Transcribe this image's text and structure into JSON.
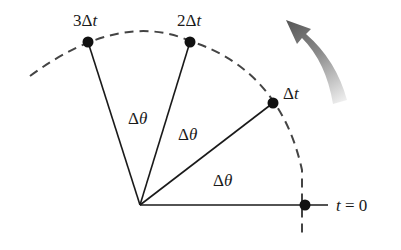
{
  "diagram": {
    "type": "uniform circular motion angular displacement",
    "colors": {
      "line": "#1a1a1a",
      "dot": "#111111",
      "arc": "#444444",
      "arrow_dark": "#555555",
      "arrow_light": "#e6e6e6",
      "background": "#ffffff"
    },
    "origin": {
      "x": 140,
      "y": 205
    },
    "points": [
      {
        "id": "t0",
        "x": 305,
        "y": 205,
        "label_prefix": "",
        "label_var": "t",
        "label_suffix": " = 0"
      },
      {
        "id": "dt1",
        "x": 273,
        "y": 103,
        "label_prefix": "Δ",
        "label_var": "t",
        "label_suffix": ""
      },
      {
        "id": "dt2",
        "x": 190,
        "y": 42,
        "label_prefix": "2Δ",
        "label_var": "t",
        "label_suffix": ""
      },
      {
        "id": "dt3",
        "x": 88,
        "y": 42,
        "label_prefix": "3Δ",
        "label_var": "t",
        "label_suffix": ""
      }
    ],
    "angle_labels": [
      {
        "prefix": "Δ",
        "var": "θ",
        "x": 213,
        "y": 186
      },
      {
        "prefix": "Δ",
        "var": "θ",
        "x": 178,
        "y": 140
      },
      {
        "prefix": "Δ",
        "var": "θ",
        "x": 128,
        "y": 124
      }
    ],
    "rotation_arrow": {
      "direction": "counterclockwise"
    }
  }
}
